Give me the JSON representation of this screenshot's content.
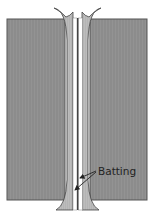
{
  "diagram": {
    "type": "cross-section",
    "colors": {
      "fabric": "#8c8c8c",
      "fabric_edge": "#555555",
      "seam_allowance": "#b4b4b4",
      "batting": "#ffffff",
      "seam_line": "#333333",
      "arrow": "#222222",
      "background": "#ffffff"
    },
    "annotations": [
      {
        "id": "batting",
        "text": "Batting",
        "arrows": 2
      }
    ]
  }
}
